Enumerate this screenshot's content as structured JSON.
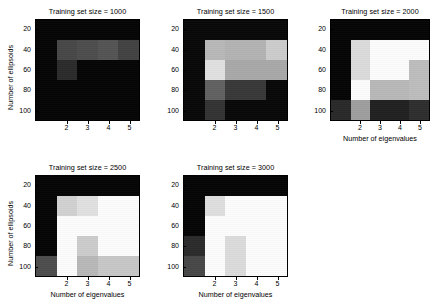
{
  "figure": {
    "name": "training-set-size-heatmap-grid",
    "background": "#ffffff",
    "subplot_count": 5,
    "shared_xlabel": "Number of eigenvalues",
    "shared_ylabel": "Number of ellipsoids"
  },
  "axis": {
    "ylabel": "Number of ellipsoids",
    "xlabel": "Number of eigenvalues",
    "yticks": [
      "20",
      "40",
      "60",
      "80",
      "100"
    ],
    "xticks": [
      "2",
      "3",
      "4",
      "5"
    ]
  },
  "chart_data": [
    {
      "type": "heatmap",
      "title": "Training set size = 1000",
      "xlabel": "Number of eigenvalues",
      "ylabel": "Number of ellipsoids",
      "x": [
        1,
        2,
        3,
        4,
        5
      ],
      "xtick_labels": [
        "2",
        "3",
        "4",
        "5"
      ],
      "y": [
        20,
        40,
        60,
        80,
        100
      ],
      "ytick_labels": [
        "20",
        "40",
        "60",
        "80",
        "100"
      ],
      "colormap": "gray",
      "clim": [
        0,
        1
      ],
      "grid": false,
      "values": [
        [
          0.02,
          0.02,
          0.02,
          0.02,
          0.02
        ],
        [
          0.02,
          0.28,
          0.3,
          0.33,
          0.26
        ],
        [
          0.02,
          0.17,
          0.02,
          0.02,
          0.02
        ],
        [
          0.02,
          0.02,
          0.02,
          0.02,
          0.02
        ],
        [
          0.02,
          0.02,
          0.02,
          0.02,
          0.02
        ]
      ]
    },
    {
      "type": "heatmap",
      "title": "Training set size = 1500",
      "xlabel": "Number of eigenvalues",
      "ylabel": "Number of ellipsoids",
      "x": [
        1,
        2,
        3,
        4,
        5
      ],
      "xtick_labels": [
        "2",
        "3",
        "4",
        "5"
      ],
      "y": [
        20,
        40,
        60,
        80,
        100
      ],
      "ytick_labels": [
        "20",
        "40",
        "60",
        "80",
        "100"
      ],
      "colormap": "gray",
      "clim": [
        0,
        1
      ],
      "grid": false,
      "values": [
        [
          0.03,
          0.03,
          0.03,
          0.03,
          0.03
        ],
        [
          0.03,
          0.72,
          0.7,
          0.7,
          0.8
        ],
        [
          0.03,
          0.88,
          0.66,
          0.66,
          0.66
        ],
        [
          0.03,
          0.38,
          0.22,
          0.22,
          0.03
        ],
        [
          0.03,
          0.2,
          0.03,
          0.03,
          0.03
        ]
      ]
    },
    {
      "type": "heatmap",
      "title": "Training set size = 2000",
      "xlabel": "Number of eigenvalues",
      "ylabel": "Number of ellipsoids",
      "x": [
        1,
        2,
        3,
        4,
        5
      ],
      "xtick_labels": [
        "2",
        "3",
        "4",
        "5"
      ],
      "y": [
        20,
        40,
        60,
        80,
        100
      ],
      "ytick_labels": [
        "20",
        "40",
        "60",
        "80",
        "100"
      ],
      "colormap": "gray",
      "clim": [
        0,
        1
      ],
      "grid": false,
      "values": [
        [
          0.02,
          0.02,
          0.02,
          0.02,
          0.02
        ],
        [
          0.02,
          0.86,
          0.99,
          0.99,
          0.99
        ],
        [
          0.02,
          0.86,
          0.99,
          0.99,
          0.74
        ],
        [
          0.02,
          0.99,
          0.72,
          0.72,
          0.74
        ],
        [
          0.16,
          0.62,
          0.13,
          0.13,
          0.18
        ]
      ]
    },
    {
      "type": "heatmap",
      "title": "Training set size = 2500",
      "xlabel": "Number of eigenvalues",
      "ylabel": "Number of ellipsoids",
      "x": [
        1,
        2,
        3,
        4,
        5
      ],
      "xtick_labels": [
        "2",
        "3",
        "4",
        "5"
      ],
      "y": [
        20,
        40,
        60,
        80,
        100
      ],
      "ytick_labels": [
        "20",
        "40",
        "60",
        "80",
        "100"
      ],
      "colormap": "gray",
      "clim": [
        0,
        1
      ],
      "grid": false,
      "values": [
        [
          0.02,
          0.02,
          0.02,
          0.02,
          0.02
        ],
        [
          0.02,
          0.82,
          0.88,
          0.99,
          0.99
        ],
        [
          0.02,
          0.99,
          0.99,
          0.99,
          0.99
        ],
        [
          0.02,
          0.99,
          0.8,
          0.99,
          0.99
        ],
        [
          0.3,
          0.99,
          0.72,
          0.78,
          0.78
        ]
      ]
    },
    {
      "type": "heatmap",
      "title": "Training set size = 3000",
      "xlabel": "Number of eigenvalues",
      "ylabel": "Number of ellipsoids",
      "x": [
        1,
        2,
        3,
        4,
        5
      ],
      "xtick_labels": [
        "2",
        "3",
        "4",
        "5"
      ],
      "y": [
        20,
        40,
        60,
        80,
        100
      ],
      "ytick_labels": [
        "20",
        "40",
        "60",
        "80",
        "100"
      ],
      "colormap": "gray",
      "clim": [
        0,
        1
      ],
      "grid": false,
      "values": [
        [
          0.02,
          0.02,
          0.02,
          0.02,
          0.02
        ],
        [
          0.02,
          0.87,
          0.99,
          0.99,
          0.99
        ],
        [
          0.02,
          0.99,
          0.99,
          0.99,
          0.99
        ],
        [
          0.17,
          0.99,
          0.86,
          0.99,
          0.99
        ],
        [
          0.28,
          0.99,
          0.86,
          0.99,
          0.99
        ]
      ]
    }
  ],
  "subplots": [
    {
      "index": 0,
      "title": "Training set size = 1000",
      "show_ylabel": true,
      "show_xlabel": false
    },
    {
      "index": 1,
      "title": "Training set size = 1500",
      "show_ylabel": false,
      "show_xlabel": false
    },
    {
      "index": 2,
      "title": "Training set size = 2000",
      "show_ylabel": false,
      "show_xlabel": true
    },
    {
      "index": 3,
      "title": "Training set size = 2500",
      "show_ylabel": true,
      "show_xlabel": true
    },
    {
      "index": 4,
      "title": "Training set size = 3000",
      "show_ylabel": false,
      "show_xlabel": true
    }
  ]
}
